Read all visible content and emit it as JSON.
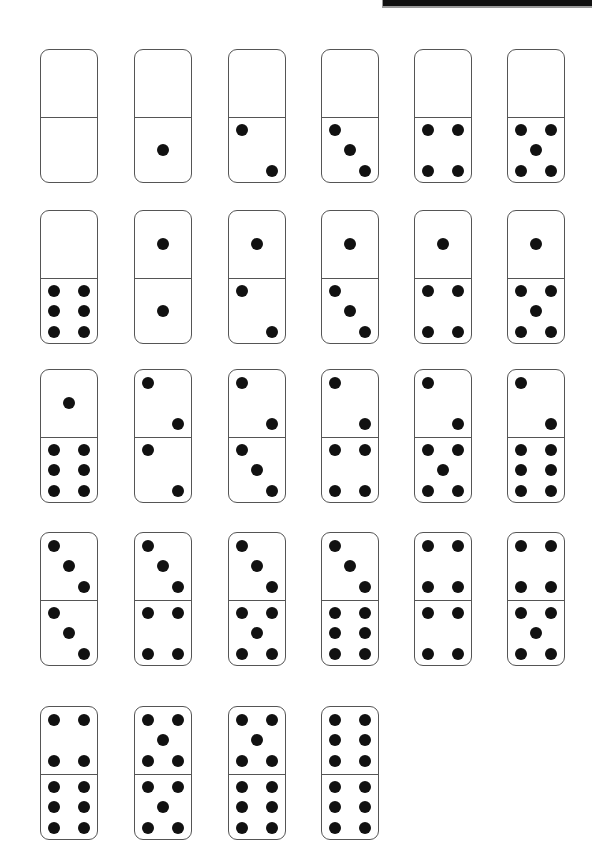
{
  "colors": {
    "pip": "#111111",
    "outline": "#555555",
    "background": "#ffffff",
    "top_bar": "#111111"
  },
  "layout": {
    "column_x": [
      40,
      134,
      228,
      321,
      414,
      507
    ],
    "row_y": [
      49,
      210,
      369,
      532,
      706
    ]
  },
  "dominoes": [
    {
      "top": 0,
      "bottom": 0
    },
    {
      "top": 0,
      "bottom": 1
    },
    {
      "top": 0,
      "bottom": 2
    },
    {
      "top": 0,
      "bottom": 3
    },
    {
      "top": 0,
      "bottom": 4
    },
    {
      "top": 0,
      "bottom": 5
    },
    {
      "top": 0,
      "bottom": 6
    },
    {
      "top": 1,
      "bottom": 1
    },
    {
      "top": 1,
      "bottom": 2
    },
    {
      "top": 1,
      "bottom": 3
    },
    {
      "top": 1,
      "bottom": 4
    },
    {
      "top": 1,
      "bottom": 5
    },
    {
      "top": 1,
      "bottom": 6
    },
    {
      "top": 2,
      "bottom": 2
    },
    {
      "top": 2,
      "bottom": 3
    },
    {
      "top": 2,
      "bottom": 4
    },
    {
      "top": 2,
      "bottom": 5
    },
    {
      "top": 2,
      "bottom": 6
    },
    {
      "top": 3,
      "bottom": 3
    },
    {
      "top": 3,
      "bottom": 4
    },
    {
      "top": 3,
      "bottom": 5
    },
    {
      "top": 3,
      "bottom": 6
    },
    {
      "top": 4,
      "bottom": 4
    },
    {
      "top": 4,
      "bottom": 5
    },
    {
      "top": 4,
      "bottom": 6
    },
    {
      "top": 5,
      "bottom": 5
    },
    {
      "top": 5,
      "bottom": 6
    },
    {
      "top": 6,
      "bottom": 6
    }
  ]
}
